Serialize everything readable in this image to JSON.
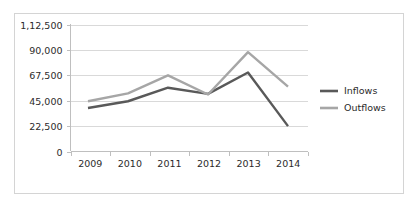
{
  "chart_data": {
    "type": "line",
    "title": "",
    "xlabel": "",
    "ylabel": "",
    "categories": [
      "2009",
      "2010",
      "2011",
      "2012",
      "2013",
      "2014"
    ],
    "series": [
      {
        "name": "Inflows",
        "color": "#595959",
        "values": [
          38500,
          44500,
          56500,
          51000,
          70000,
          22500
        ]
      },
      {
        "name": "Outflows",
        "color": "#a6a6a6",
        "values": [
          44500,
          51500,
          67500,
          50500,
          88000,
          57500
        ]
      }
    ],
    "ylim": [
      0,
      112500
    ],
    "ytick_labels": [
      "0",
      "22,500",
      "45,000",
      "67,500",
      "90,000",
      "1,12,500"
    ],
    "ytick_values": [
      0,
      22500,
      45000,
      67500,
      90000,
      112500
    ],
    "xtick_labels": [
      "2009",
      "2010",
      "2011",
      "2012",
      "2013",
      "2014"
    ],
    "grid": true,
    "legend_position": "right"
  },
  "legend": {
    "entries": [
      {
        "label": "Inflows",
        "color": "#595959"
      },
      {
        "label": "Outflows",
        "color": "#a6a6a6"
      }
    ]
  },
  "colors": {
    "inflows": "#595959",
    "outflows": "#a6a6a6",
    "gridline": "#d9d9d9",
    "axis": "#bfbfbf",
    "frame_border": "#d4d4d4",
    "text": "#2b2b2b",
    "background": "#ffffff"
  }
}
